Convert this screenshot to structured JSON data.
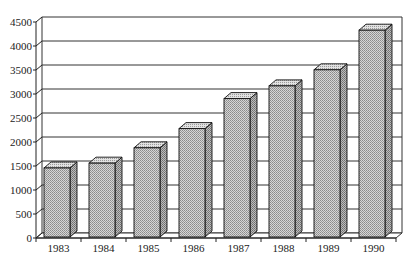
{
  "chart_data": {
    "type": "bar",
    "style": "3d-column",
    "title": "",
    "xlabel": "",
    "ylabel": "",
    "categories": [
      "1983",
      "1984",
      "1985",
      "1986",
      "1987",
      "1988",
      "1989",
      "1990"
    ],
    "values": [
      1480,
      1580,
      1900,
      2300,
      2925,
      3190,
      3525,
      4350
    ],
    "ylim": [
      0,
      4500
    ],
    "yticks": [
      0,
      500,
      1000,
      1500,
      2000,
      2500,
      3000,
      3500,
      4000,
      4500
    ],
    "grid": true,
    "legend": null,
    "colors": {
      "bar_fill": "#b8b8b8",
      "bar_stroke": "#222222",
      "grid": "#333333"
    }
  }
}
